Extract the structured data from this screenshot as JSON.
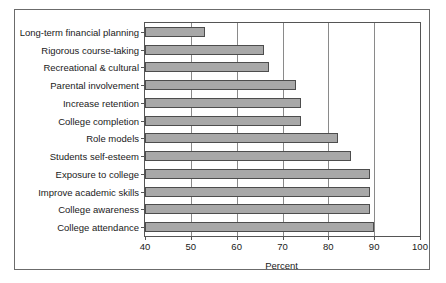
{
  "chart_data": {
    "type": "bar",
    "orientation": "horizontal",
    "title": "",
    "xlabel": "Percent",
    "ylabel": "",
    "xlim": [
      40,
      100
    ],
    "xticks": [
      40,
      50,
      60,
      70,
      80,
      90,
      100
    ],
    "xticklabels": [
      "40",
      "50",
      "60",
      "70",
      "80",
      "90",
      "100"
    ],
    "grid": "vertical",
    "legend": "none",
    "bar_color": "#a8a8a8",
    "bar_edge_color": "#4d4d4d",
    "categories": [
      "Long-term financial planning",
      "Rigorous course-taking",
      "Recreational & cultural",
      "Parental involvement",
      "Increase retention",
      "College completion",
      "Role models",
      "Students self-esteem",
      "Exposure to college",
      "Improve academic skills",
      "College awareness",
      "College attendance"
    ],
    "values": [
      53,
      66,
      67,
      73,
      74,
      74,
      82,
      85,
      89,
      89,
      89,
      90
    ]
  }
}
